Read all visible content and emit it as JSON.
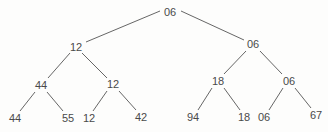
{
  "diagram": {
    "type": "tree",
    "text_color": "#4a4a4a",
    "edge_color": "#555555",
    "nodes": [
      {
        "id": "n0",
        "label": "06",
        "x": 170,
        "y": 12
      },
      {
        "id": "n1",
        "label": "12",
        "x": 76,
        "y": 47
      },
      {
        "id": "n2",
        "label": "06",
        "x": 253,
        "y": 44
      },
      {
        "id": "n3",
        "label": "44",
        "x": 41,
        "y": 85
      },
      {
        "id": "n4",
        "label": "12",
        "x": 113,
        "y": 84
      },
      {
        "id": "n5",
        "label": "18",
        "x": 218,
        "y": 81
      },
      {
        "id": "n6",
        "label": "06",
        "x": 289,
        "y": 81
      },
      {
        "id": "n7",
        "label": "44",
        "x": 15,
        "y": 118
      },
      {
        "id": "n8",
        "label": "55",
        "x": 68,
        "y": 118
      },
      {
        "id": "n9",
        "label": "12",
        "x": 89,
        "y": 118
      },
      {
        "id": "n10",
        "label": "42",
        "x": 141,
        "y": 117
      },
      {
        "id": "n11",
        "label": "94",
        "x": 193,
        "y": 117
      },
      {
        "id": "n12",
        "label": "18",
        "x": 244,
        "y": 117
      },
      {
        "id": "n13",
        "label": "06",
        "x": 264,
        "y": 117
      },
      {
        "id": "n14",
        "label": "67",
        "x": 316,
        "y": 115
      }
    ],
    "edges": [
      {
        "from": "n0",
        "to": "n1",
        "x1": 160,
        "y1": 11,
        "x2": 86,
        "y2": 42
      },
      {
        "from": "n0",
        "to": "n2",
        "x1": 181,
        "y1": 11,
        "x2": 244,
        "y2": 40
      },
      {
        "from": "n1",
        "to": "n3",
        "x1": 70,
        "y1": 53,
        "x2": 48,
        "y2": 78
      },
      {
        "from": "n1",
        "to": "n4",
        "x1": 82,
        "y1": 53,
        "x2": 107,
        "y2": 78
      },
      {
        "from": "n2",
        "to": "n5",
        "x1": 246,
        "y1": 51,
        "x2": 224,
        "y2": 74
      },
      {
        "from": "n2",
        "to": "n6",
        "x1": 260,
        "y1": 51,
        "x2": 282,
        "y2": 74
      },
      {
        "from": "n3",
        "to": "n7",
        "x1": 35,
        "y1": 92,
        "x2": 20,
        "y2": 111
      },
      {
        "from": "n3",
        "to": "n8",
        "x1": 47,
        "y1": 92,
        "x2": 63,
        "y2": 111
      },
      {
        "from": "n4",
        "to": "n9",
        "x1": 107,
        "y1": 91,
        "x2": 93,
        "y2": 111
      },
      {
        "from": "n4",
        "to": "n10",
        "x1": 119,
        "y1": 91,
        "x2": 136,
        "y2": 110
      },
      {
        "from": "n5",
        "to": "n11",
        "x1": 212,
        "y1": 88,
        "x2": 198,
        "y2": 110
      },
      {
        "from": "n5",
        "to": "n12",
        "x1": 224,
        "y1": 88,
        "x2": 240,
        "y2": 110
      },
      {
        "from": "n6",
        "to": "n13",
        "x1": 283,
        "y1": 88,
        "x2": 269,
        "y2": 110
      },
      {
        "from": "n6",
        "to": "n14",
        "x1": 295,
        "y1": 88,
        "x2": 311,
        "y2": 108
      }
    ]
  }
}
